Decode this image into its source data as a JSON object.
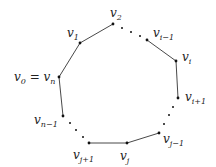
{
  "diagram": {
    "colors": {
      "edge": "#333333",
      "vertex": "#111111",
      "label": "#222222",
      "background": "#ffffff"
    },
    "vertices": [
      {
        "id": "v0",
        "x": 59,
        "y": 77,
        "label": "v",
        "sub": "0",
        "suffix": " = v",
        "suffix_sub": "n"
      },
      {
        "id": "v1",
        "x": 80,
        "y": 43,
        "label": "v",
        "sub": "1"
      },
      {
        "id": "v2",
        "x": 113,
        "y": 24,
        "label": "v",
        "sub": "2"
      },
      {
        "id": "vi-1",
        "x": 147,
        "y": 40,
        "label": "v",
        "sub": "i−1"
      },
      {
        "id": "vi",
        "x": 176,
        "y": 61,
        "label": "v",
        "sub": "i"
      },
      {
        "id": "vi+1",
        "x": 178,
        "y": 98,
        "label": "v",
        "sub": "i+1"
      },
      {
        "id": "vj-1",
        "x": 159,
        "y": 133,
        "label": "v",
        "sub": "j−1"
      },
      {
        "id": "vj",
        "x": 127,
        "y": 143,
        "label": "v",
        "sub": "j"
      },
      {
        "id": "vj+1",
        "x": 89,
        "y": 143,
        "label": "v",
        "sub": "j+1"
      },
      {
        "id": "vn-1",
        "x": 63,
        "y": 116,
        "label": "v",
        "sub": "n−1"
      }
    ],
    "edges": [
      [
        "v0",
        "v1"
      ],
      [
        "v1",
        "v2"
      ],
      [
        "vi-1",
        "vi"
      ],
      [
        "vi",
        "vi+1"
      ],
      [
        "vj-1",
        "vj"
      ],
      [
        "vj",
        "vj+1"
      ],
      [
        "vn-1",
        "v0"
      ]
    ],
    "ellipses": [
      {
        "between": [
          "v2",
          "vi-1"
        ],
        "dots": [
          [
            122,
            28
          ],
          [
            131,
            32
          ],
          [
            140,
            36
          ]
        ]
      },
      {
        "between": [
          "vi+1",
          "vj-1"
        ],
        "dots": [
          [
            173,
            107
          ],
          [
            169,
            115
          ],
          [
            164,
            124
          ]
        ]
      },
      {
        "between": [
          "vj+1",
          "vn-1"
        ],
        "dots": [
          [
            70,
            123
          ],
          [
            76,
            130
          ],
          [
            83,
            137
          ]
        ]
      }
    ]
  }
}
